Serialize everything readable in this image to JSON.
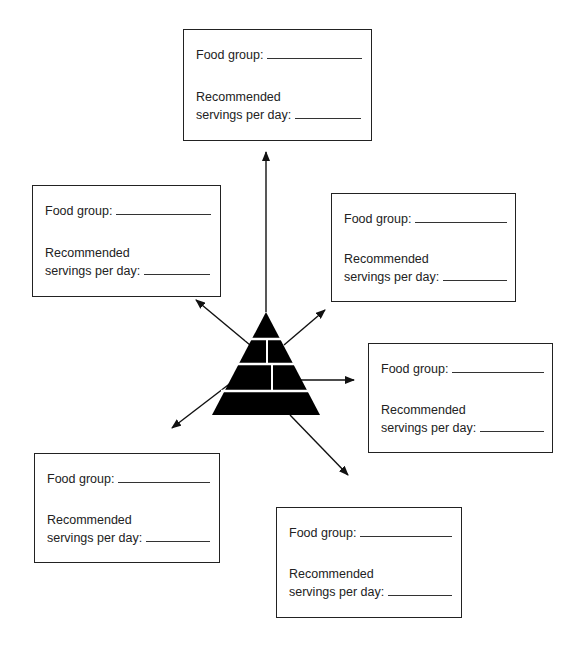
{
  "center": {
    "shape": "food-pyramid",
    "tiers": 4
  },
  "boxes": [
    {
      "position": "top",
      "food_group_label": "Food group:",
      "servings_line1": "Recommended",
      "servings_line2": "servings per day:"
    },
    {
      "position": "upper-left",
      "food_group_label": "Food group:",
      "servings_line1": "Recommended",
      "servings_line2": "servings per day:"
    },
    {
      "position": "upper-right",
      "food_group_label": "Food group:",
      "servings_line1": "Recommended",
      "servings_line2": "servings per day:"
    },
    {
      "position": "right",
      "food_group_label": "Food group:",
      "servings_line1": "Recommended",
      "servings_line2": "servings per day:"
    },
    {
      "position": "lower-left",
      "food_group_label": "Food group:",
      "servings_line1": "Recommended",
      "servings_line2": "servings per day:"
    },
    {
      "position": "lower-right",
      "food_group_label": "Food group:",
      "servings_line1": "Recommended",
      "servings_line2": "servings per day:"
    }
  ]
}
